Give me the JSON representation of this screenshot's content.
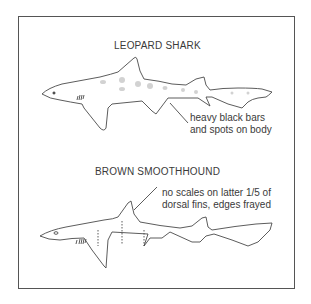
{
  "figures": [
    {
      "title": "LEOPARD SHARK",
      "annotation_line1": "heavy black bars",
      "annotation_line2": "and spots on body"
    },
    {
      "title": "BROWN SMOOTHHOUND",
      "annotation_line1": "no scales on latter 1/5 of",
      "annotation_line2": "dorsal fins, edges frayed"
    }
  ],
  "colors": {
    "line": "#4a4a4a",
    "frame": "#555555",
    "spots": "#c8c8c8"
  }
}
